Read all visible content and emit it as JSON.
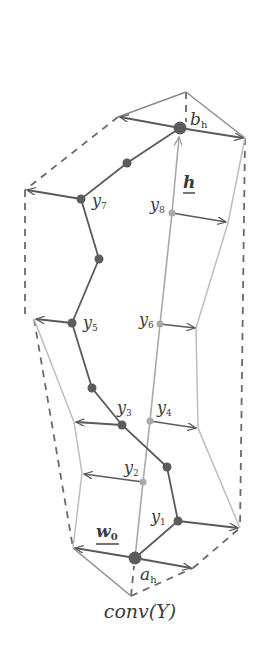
{
  "caption": "conv(Y)",
  "colors": {
    "dark": "#555555",
    "mid": "#7a7a7a",
    "light": "#b8b8b8",
    "dashed": "#6a6a6a",
    "label": "#3a3a3a"
  },
  "labels": {
    "b_h": {
      "main": "b",
      "sub": "h"
    },
    "a_h": {
      "main": "a",
      "sub": "h"
    },
    "h": "h",
    "w0": {
      "main": "w",
      "sub": "0"
    },
    "y1": {
      "main": "y",
      "sub": "1"
    },
    "y2": {
      "main": "y",
      "sub": "2"
    },
    "y3": {
      "main": "y",
      "sub": "3"
    },
    "y4": {
      "main": "y",
      "sub": "4"
    },
    "y5": {
      "main": "y",
      "sub": "5"
    },
    "y6": {
      "main": "y",
      "sub": "6"
    },
    "y7": {
      "main": "y",
      "sub": "7"
    },
    "y8": {
      "main": "y",
      "sub": "8"
    }
  },
  "points": {
    "a_h": [
      135,
      558
    ],
    "b_h": [
      180,
      128
    ],
    "y1": [
      178,
      521
    ],
    "y2": [
      143,
      482
    ],
    "y3": [
      122,
      425
    ],
    "y4": [
      150,
      421
    ],
    "y5": [
      72,
      323
    ],
    "y6": [
      160,
      324
    ],
    "y7": [
      81,
      199
    ],
    "y8": [
      172,
      213
    ],
    "mid_a": [
      167,
      467
    ],
    "mid_b": [
      92,
      388
    ],
    "mid_c": [
      99,
      259
    ],
    "mid_d": [
      127,
      163
    ],
    "top_vertex": [
      186,
      92
    ],
    "bottom_vertex": [
      131,
      596
    ]
  }
}
